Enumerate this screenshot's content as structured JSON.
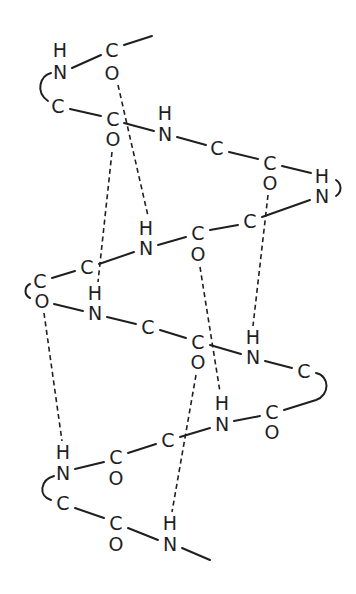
{
  "diagram": {
    "title": "",
    "colors": {
      "ink": "#1f1f1f",
      "background": "#ffffff"
    },
    "atoms": [
      {
        "id": "a1",
        "label": "H",
        "x": 60,
        "y": 50
      },
      {
        "id": "a2",
        "label": "N",
        "x": 60,
        "y": 72
      },
      {
        "id": "a3",
        "label": "C",
        "x": 112,
        "y": 50
      },
      {
        "id": "a4",
        "label": "O",
        "x": 112,
        "y": 73
      },
      {
        "id": "a5",
        "label": "C",
        "x": 58,
        "y": 106
      },
      {
        "id": "a6",
        "label": "C",
        "x": 113,
        "y": 119
      },
      {
        "id": "a7",
        "label": "O",
        "x": 113,
        "y": 139
      },
      {
        "id": "a8",
        "label": "H",
        "x": 165,
        "y": 113
      },
      {
        "id": "a9",
        "label": "N",
        "x": 165,
        "y": 134
      },
      {
        "id": "a10",
        "label": "C",
        "x": 217,
        "y": 148
      },
      {
        "id": "a11",
        "label": "C",
        "x": 270,
        "y": 163
      },
      {
        "id": "a12",
        "label": "O",
        "x": 270,
        "y": 183
      },
      {
        "id": "a13",
        "label": "H",
        "x": 322,
        "y": 176
      },
      {
        "id": "a14",
        "label": "N",
        "x": 322,
        "y": 196
      },
      {
        "id": "a15",
        "label": "C",
        "x": 250,
        "y": 221
      },
      {
        "id": "a16",
        "label": "C",
        "x": 198,
        "y": 233
      },
      {
        "id": "a17",
        "label": "O",
        "x": 198,
        "y": 254
      },
      {
        "id": "a18",
        "label": "H",
        "x": 146,
        "y": 228
      },
      {
        "id": "a19",
        "label": "N",
        "x": 146,
        "y": 248
      },
      {
        "id": "a20",
        "label": "C",
        "x": 87,
        "y": 267
      },
      {
        "id": "a21",
        "label": "C",
        "x": 40,
        "y": 281
      },
      {
        "id": "a22",
        "label": "O",
        "x": 42,
        "y": 301
      },
      {
        "id": "a23",
        "label": "H",
        "x": 95,
        "y": 293
      },
      {
        "id": "a24",
        "label": "N",
        "x": 95,
        "y": 313
      },
      {
        "id": "a25",
        "label": "C",
        "x": 148,
        "y": 327
      },
      {
        "id": "a26",
        "label": "C",
        "x": 198,
        "y": 342
      },
      {
        "id": "a27",
        "label": "O",
        "x": 198,
        "y": 362
      },
      {
        "id": "a28",
        "label": "H",
        "x": 253,
        "y": 337
      },
      {
        "id": "a29",
        "label": "N",
        "x": 253,
        "y": 357
      },
      {
        "id": "a30",
        "label": "C",
        "x": 304,
        "y": 371
      },
      {
        "id": "a31",
        "label": "C",
        "x": 272,
        "y": 412
      },
      {
        "id": "a32",
        "label": "O",
        "x": 272,
        "y": 432
      },
      {
        "id": "a33",
        "label": "H",
        "x": 222,
        "y": 403
      },
      {
        "id": "a34",
        "label": "N",
        "x": 222,
        "y": 424
      },
      {
        "id": "a35",
        "label": "C",
        "x": 168,
        "y": 440
      },
      {
        "id": "a36",
        "label": "C",
        "x": 116,
        "y": 457
      },
      {
        "id": "a37",
        "label": "O",
        "x": 116,
        "y": 478
      },
      {
        "id": "a38",
        "label": "H",
        "x": 63,
        "y": 452
      },
      {
        "id": "a39",
        "label": "N",
        "x": 63,
        "y": 473
      },
      {
        "id": "a40",
        "label": "C",
        "x": 63,
        "y": 503
      },
      {
        "id": "a41",
        "label": "C",
        "x": 116,
        "y": 523
      },
      {
        "id": "a42",
        "label": "O",
        "x": 116,
        "y": 544
      },
      {
        "id": "a43",
        "label": "H",
        "x": 170,
        "y": 523
      },
      {
        "id": "a44",
        "label": "N",
        "x": 170,
        "y": 544
      }
    ]
  }
}
